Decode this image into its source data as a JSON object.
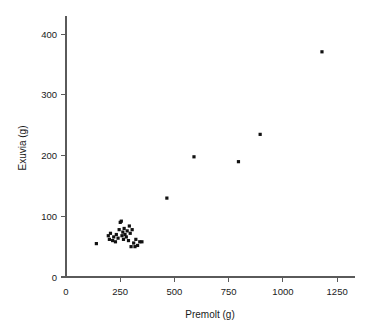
{
  "chart_data": {
    "type": "scatter",
    "title": "",
    "xlabel": "Premolt (g)",
    "ylabel": "Exuvia (g)",
    "xlim": [
      0,
      1300
    ],
    "ylim": [
      0,
      430
    ],
    "xticks": [
      0,
      250,
      500,
      750,
      1000,
      1250
    ],
    "yticks": [
      0,
      100,
      200,
      300,
      400
    ],
    "xtick_labels": [
      "0",
      "250",
      "500",
      "750",
      "1000",
      "1250"
    ],
    "ytick_labels": [
      "0",
      "100",
      "200",
      "300",
      "400"
    ],
    "grid": false,
    "legend": null,
    "marker": "square",
    "marker_color": "#111111",
    "marker_size": 3.2,
    "points": [
      {
        "x": 140,
        "y": 55
      },
      {
        "x": 195,
        "y": 68
      },
      {
        "x": 200,
        "y": 62
      },
      {
        "x": 205,
        "y": 72
      },
      {
        "x": 215,
        "y": 60
      },
      {
        "x": 220,
        "y": 66
      },
      {
        "x": 228,
        "y": 58
      },
      {
        "x": 232,
        "y": 70
      },
      {
        "x": 240,
        "y": 64
      },
      {
        "x": 245,
        "y": 78
      },
      {
        "x": 250,
        "y": 90
      },
      {
        "x": 255,
        "y": 92
      },
      {
        "x": 258,
        "y": 68
      },
      {
        "x": 262,
        "y": 74
      },
      {
        "x": 265,
        "y": 62
      },
      {
        "x": 268,
        "y": 80
      },
      {
        "x": 272,
        "y": 70
      },
      {
        "x": 278,
        "y": 66
      },
      {
        "x": 282,
        "y": 76
      },
      {
        "x": 288,
        "y": 60
      },
      {
        "x": 292,
        "y": 84
      },
      {
        "x": 296,
        "y": 72
      },
      {
        "x": 300,
        "y": 50
      },
      {
        "x": 305,
        "y": 78
      },
      {
        "x": 312,
        "y": 56
      },
      {
        "x": 318,
        "y": 50
      },
      {
        "x": 322,
        "y": 62
      },
      {
        "x": 330,
        "y": 52
      },
      {
        "x": 340,
        "y": 58
      },
      {
        "x": 350,
        "y": 58
      },
      {
        "x": 465,
        "y": 130
      },
      {
        "x": 590,
        "y": 198
      },
      {
        "x": 795,
        "y": 190
      },
      {
        "x": 895,
        "y": 235
      },
      {
        "x": 1180,
        "y": 371
      }
    ]
  },
  "figure": {
    "background_color": "#ffffff",
    "axis_color": "#5a5a5a",
    "text_color": "#1a1a1a"
  }
}
